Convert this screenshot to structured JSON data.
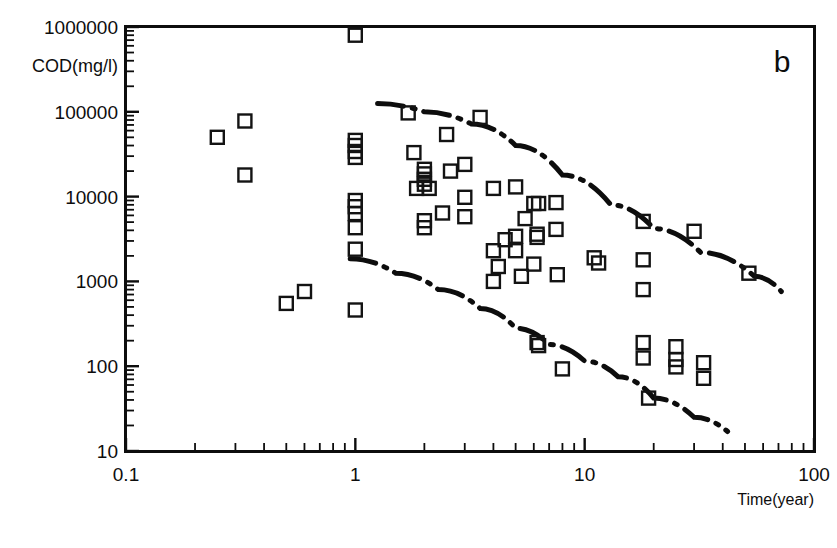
{
  "figure": {
    "panel_letter": "b",
    "caption_fragment": ""
  },
  "chart_data": {
    "type": "scatter",
    "title": "",
    "xlabel": "Time(year)",
    "ylabel": "COD(mg/l)",
    "xscale": "log",
    "yscale": "log",
    "xlim": [
      0.1,
      100
    ],
    "ylim": [
      10,
      1000000
    ],
    "grid": false,
    "legend": null,
    "xticks": [
      0.1,
      1,
      10,
      100
    ],
    "xtick_labels": [
      "0.1",
      "1",
      "10",
      "100"
    ],
    "yticks": [
      10,
      100,
      1000,
      10000,
      100000,
      1000000
    ],
    "ytick_labels": [
      "10",
      "100",
      "1000",
      "10000",
      "100000",
      "1000000"
    ],
    "marker": "open-square",
    "points": [
      [
        0.25,
        50000
      ],
      [
        0.33,
        78000
      ],
      [
        0.33,
        18000
      ],
      [
        0.5,
        550
      ],
      [
        0.6,
        760
      ],
      [
        1.0,
        800000
      ],
      [
        1.0,
        46000
      ],
      [
        1.0,
        40000
      ],
      [
        1.0,
        34000
      ],
      [
        1.0,
        29000
      ],
      [
        1.0,
        9000
      ],
      [
        1.0,
        7600
      ],
      [
        1.0,
        6300
      ],
      [
        1.0,
        4300
      ],
      [
        1.0,
        2400
      ],
      [
        1.0,
        460
      ],
      [
        1.7,
        97000
      ],
      [
        1.8,
        33000
      ],
      [
        2.0,
        21000
      ],
      [
        2.0,
        18500
      ],
      [
        2.0,
        16000
      ],
      [
        2.0,
        14000
      ],
      [
        1.85,
        12500
      ],
      [
        2.1,
        12500
      ],
      [
        2.0,
        5200
      ],
      [
        2.0,
        4300
      ],
      [
        2.5,
        54000
      ],
      [
        2.6,
        20000
      ],
      [
        2.4,
        6400
      ],
      [
        3.0,
        24000
      ],
      [
        3.0,
        9800
      ],
      [
        3.0,
        5800
      ],
      [
        3.5,
        86000
      ],
      [
        4.0,
        12500
      ],
      [
        4.0,
        2300
      ],
      [
        4.2,
        1500
      ],
      [
        4.0,
        1000
      ],
      [
        4.5,
        3100
      ],
      [
        5.0,
        13000
      ],
      [
        5.0,
        3400
      ],
      [
        5.0,
        2300
      ],
      [
        5.3,
        1150
      ],
      [
        5.5,
        5500
      ],
      [
        6.0,
        8300
      ],
      [
        6.3,
        8300
      ],
      [
        6.2,
        3600
      ],
      [
        6.2,
        3300
      ],
      [
        6.0,
        1600
      ],
      [
        6.2,
        190
      ],
      [
        6.3,
        175
      ],
      [
        7.5,
        8500
      ],
      [
        7.5,
        4100
      ],
      [
        7.6,
        1200
      ],
      [
        8.0,
        93
      ],
      [
        11,
        1900
      ],
      [
        11.5,
        1650
      ],
      [
        18,
        5100
      ],
      [
        18,
        1800
      ],
      [
        18,
        800
      ],
      [
        18,
        190
      ],
      [
        18,
        125
      ],
      [
        19,
        42
      ],
      [
        25,
        170
      ],
      [
        25,
        120
      ],
      [
        25,
        98
      ],
      [
        30,
        3900
      ],
      [
        33,
        110
      ],
      [
        33,
        72
      ],
      [
        52,
        1250
      ]
    ],
    "envelopes": [
      {
        "name": "upper-bound-curve",
        "style": "dash-dot",
        "points": [
          [
            1.25,
            125000
          ],
          [
            2.0,
            100000
          ],
          [
            3.2,
            72000
          ],
          [
            5.0,
            40000
          ],
          [
            8.0,
            18000
          ],
          [
            13,
            8000
          ],
          [
            20,
            4200
          ],
          [
            32,
            2200
          ],
          [
            55,
            1150
          ],
          [
            72,
            760
          ]
        ]
      },
      {
        "name": "lower-bound-curve",
        "style": "dash-dot",
        "points": [
          [
            0.95,
            1850
          ],
          [
            1.5,
            1250
          ],
          [
            2.3,
            800
          ],
          [
            3.5,
            480
          ],
          [
            5.0,
            280
          ],
          [
            7.0,
            180
          ],
          [
            10,
            115
          ],
          [
            14,
            75
          ],
          [
            20,
            42
          ],
          [
            30,
            25
          ],
          [
            42,
            17
          ]
        ]
      }
    ]
  }
}
